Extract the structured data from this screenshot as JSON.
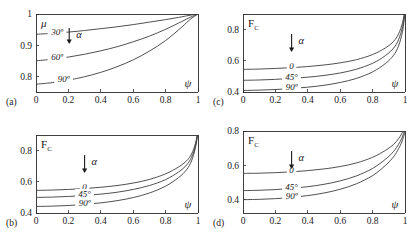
{
  "figure": {
    "panel_count": 4,
    "background_color": "#ffffff",
    "line_color": "#3c3c3c",
    "text_color": "#1a1a1a"
  },
  "chart_data": [
    {
      "type": "line",
      "panel_tag": "(a)",
      "title": "",
      "ylabel": "μ",
      "xlabel": "ψ",
      "xlim": [
        0,
        1
      ],
      "ylim": [
        0.75,
        1
      ],
      "xticks": [
        0,
        0.2,
        0.4,
        0.6,
        0.8,
        1
      ],
      "xticklabels": [
        "0",
        "0.2",
        "0.4",
        "0.6",
        "0.8",
        "1"
      ],
      "yticks": [
        0.8,
        0.9,
        1
      ],
      "yticklabels": [
        "0.8",
        "0.9",
        "1"
      ],
      "grid": false,
      "legend": "inline-curve-labels",
      "annotation_symbol": "α",
      "annotation_arrow": "down",
      "series": [
        {
          "name": "30º",
          "label": "30º",
          "x": [
            0,
            0.1,
            0.2,
            0.3,
            0.4,
            0.5,
            0.6,
            0.7,
            0.8,
            0.9,
            0.95,
            1
          ],
          "y": [
            0.935,
            0.938,
            0.942,
            0.947,
            0.953,
            0.959,
            0.966,
            0.974,
            0.982,
            0.991,
            0.996,
            1
          ]
        },
        {
          "name": "60º",
          "label": "60º",
          "x": [
            0,
            0.1,
            0.2,
            0.3,
            0.4,
            0.5,
            0.6,
            0.7,
            0.8,
            0.9,
            0.95,
            1
          ],
          "y": [
            0.85,
            0.855,
            0.862,
            0.871,
            0.882,
            0.895,
            0.911,
            0.929,
            0.951,
            0.976,
            0.989,
            1
          ]
        },
        {
          "name": "90º",
          "label": "90º",
          "x": [
            0,
            0.1,
            0.2,
            0.3,
            0.4,
            0.5,
            0.6,
            0.7,
            0.8,
            0.9,
            0.95,
            1
          ],
          "y": [
            0.775,
            0.78,
            0.788,
            0.799,
            0.813,
            0.831,
            0.853,
            0.881,
            0.915,
            0.958,
            0.982,
            1
          ]
        }
      ]
    },
    {
      "type": "line",
      "panel_tag": "(c)",
      "title": "",
      "ylabel": "F",
      "ylabel_subscript": "C",
      "xlabel": "ψ",
      "xlim": [
        0,
        1
      ],
      "ylim": [
        0.4,
        0.9
      ],
      "xticks": [
        0,
        0.2,
        0.4,
        0.6,
        0.8,
        1
      ],
      "xticklabels": [
        "0",
        "0.2",
        "0.4",
        "0.6",
        "0.8",
        "1"
      ],
      "yticks": [
        0.4,
        0.6,
        0.8
      ],
      "yticklabels": [
        "0.4",
        "0.6",
        "0.8"
      ],
      "grid": false,
      "legend": "inline-curve-labels",
      "annotation_symbol": "α",
      "annotation_arrow": "down",
      "series": [
        {
          "name": "0",
          "label": "0",
          "x": [
            0,
            0.1,
            0.2,
            0.3,
            0.4,
            0.5,
            0.6,
            0.7,
            0.8,
            0.88,
            0.93,
            0.96,
            0.985,
            1
          ],
          "y": [
            0.545,
            0.547,
            0.551,
            0.556,
            0.563,
            0.573,
            0.587,
            0.607,
            0.64,
            0.683,
            0.725,
            0.772,
            0.845,
            0.93
          ]
        },
        {
          "name": "45°",
          "label": "45°",
          "x": [
            0,
            0.1,
            0.2,
            0.3,
            0.4,
            0.5,
            0.6,
            0.7,
            0.8,
            0.88,
            0.93,
            0.96,
            0.985,
            1
          ],
          "y": [
            0.475,
            0.477,
            0.481,
            0.487,
            0.495,
            0.506,
            0.522,
            0.546,
            0.584,
            0.634,
            0.682,
            0.735,
            0.82,
            0.92
          ]
        },
        {
          "name": "90º",
          "label": "90º",
          "x": [
            0,
            0.1,
            0.2,
            0.3,
            0.4,
            0.5,
            0.6,
            0.7,
            0.8,
            0.88,
            0.93,
            0.96,
            0.985,
            1
          ],
          "y": [
            0.41,
            0.412,
            0.416,
            0.422,
            0.431,
            0.443,
            0.461,
            0.487,
            0.529,
            0.583,
            0.636,
            0.695,
            0.79,
            0.905
          ]
        }
      ]
    },
    {
      "type": "line",
      "panel_tag": "(b)",
      "title": "",
      "ylabel": "F",
      "ylabel_subscript": "C",
      "xlabel": "ψ",
      "xlim": [
        0,
        1
      ],
      "ylim": [
        0.4,
        0.9
      ],
      "xticks": [
        0,
        0.2,
        0.4,
        0.6,
        0.8,
        1
      ],
      "xticklabels": [
        "0",
        "0.2",
        "0.4",
        "0.6",
        "0.8",
        "1"
      ],
      "yticks": [
        0.4,
        0.6,
        0.8
      ],
      "yticklabels": [
        "0.4",
        "0.6",
        "0.8"
      ],
      "grid": false,
      "legend": "inline-curve-labels",
      "annotation_symbol": "α",
      "annotation_arrow": "down",
      "series": [
        {
          "name": "0",
          "label": "0",
          "x": [
            0,
            0.1,
            0.2,
            0.3,
            0.4,
            0.5,
            0.6,
            0.7,
            0.8,
            0.88,
            0.93,
            0.96,
            0.985,
            1
          ],
          "y": [
            0.545,
            0.547,
            0.551,
            0.557,
            0.565,
            0.576,
            0.592,
            0.615,
            0.651,
            0.695,
            0.735,
            0.778,
            0.848,
            0.93
          ]
        },
        {
          "name": "45°",
          "label": "45°",
          "x": [
            0,
            0.1,
            0.2,
            0.3,
            0.4,
            0.5,
            0.6,
            0.7,
            0.8,
            0.88,
            0.93,
            0.96,
            0.985,
            1
          ],
          "y": [
            0.5,
            0.502,
            0.506,
            0.512,
            0.521,
            0.533,
            0.551,
            0.576,
            0.614,
            0.663,
            0.708,
            0.757,
            0.834,
            0.925
          ]
        },
        {
          "name": "90º",
          "label": "90º",
          "x": [
            0,
            0.1,
            0.2,
            0.3,
            0.4,
            0.5,
            0.6,
            0.7,
            0.8,
            0.88,
            0.93,
            0.96,
            0.985,
            1
          ],
          "y": [
            0.442,
            0.444,
            0.448,
            0.455,
            0.465,
            0.479,
            0.499,
            0.528,
            0.572,
            0.627,
            0.678,
            0.734,
            0.822,
            0.92
          ]
        }
      ]
    },
    {
      "type": "line",
      "panel_tag": "(d)",
      "title": "",
      "ylabel": "F",
      "ylabel_subscript": "C",
      "xlabel": "ψ",
      "xlim": [
        0,
        1
      ],
      "ylim": [
        0.32,
        0.8
      ],
      "xticks": [
        0,
        0.2,
        0.4,
        0.6,
        0.8,
        1
      ],
      "xticklabels": [
        "0",
        "0.2",
        "0.4",
        "0.6",
        "0.8",
        "1"
      ],
      "yticks": [
        0.4,
        0.6,
        0.8
      ],
      "yticklabels": [
        "0.4",
        "0.6",
        "0.8"
      ],
      "grid": false,
      "legend": "inline-curve-labels",
      "annotation_symbol": "α",
      "annotation_arrow": "down",
      "series": [
        {
          "name": "0",
          "label": "0",
          "x": [
            0,
            0.1,
            0.2,
            0.3,
            0.4,
            0.5,
            0.6,
            0.7,
            0.8,
            0.88,
            0.93,
            0.96,
            0.98,
            1
          ],
          "y": [
            0.552,
            0.553,
            0.556,
            0.561,
            0.568,
            0.578,
            0.592,
            0.613,
            0.646,
            0.687,
            0.722,
            0.755,
            0.785,
            0.83
          ]
        },
        {
          "name": "45°",
          "label": "45°",
          "x": [
            0,
            0.1,
            0.2,
            0.3,
            0.4,
            0.5,
            0.6,
            0.7,
            0.8,
            0.88,
            0.93,
            0.96,
            0.98,
            1
          ],
          "y": [
            0.451,
            0.453,
            0.457,
            0.464,
            0.474,
            0.488,
            0.508,
            0.537,
            0.581,
            0.635,
            0.681,
            0.722,
            0.757,
            0.81
          ]
        },
        {
          "name": "90º",
          "label": "90º",
          "x": [
            0,
            0.1,
            0.2,
            0.3,
            0.4,
            0.5,
            0.6,
            0.7,
            0.8,
            0.88,
            0.93,
            0.96,
            0.98,
            1
          ],
          "y": [
            0.398,
            0.4,
            0.404,
            0.411,
            0.422,
            0.437,
            0.459,
            0.491,
            0.539,
            0.599,
            0.65,
            0.696,
            0.735,
            0.795
          ]
        }
      ]
    }
  ]
}
